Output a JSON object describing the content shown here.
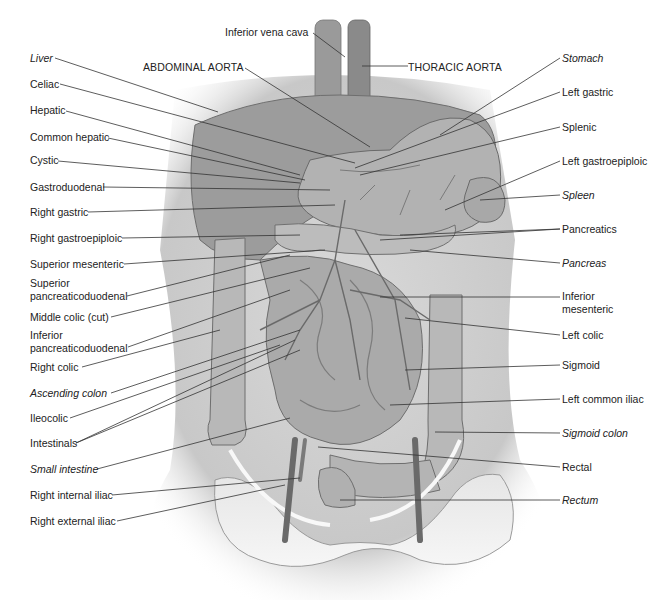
{
  "diagram": {
    "type": "anatomical-illustration",
    "top_labels": {
      "inferior_vena_cava": "Inferior vena cava",
      "abdominal_aorta": "ABDOMINAL AORTA",
      "thoracic_aorta": "THORACIC AORTA"
    },
    "left_labels": [
      {
        "text": "Liver",
        "italic": true
      },
      {
        "text": "Celiac",
        "italic": false
      },
      {
        "text": "Hepatic",
        "italic": false
      },
      {
        "text": "Common hepatic",
        "italic": false
      },
      {
        "text": "Cystic",
        "italic": false
      },
      {
        "text": "Gastroduodenal",
        "italic": false
      },
      {
        "text": "Right gastric",
        "italic": false
      },
      {
        "text": "Right gastroepiploic",
        "italic": false
      },
      {
        "text": "Superior mesenteric",
        "italic": false
      },
      {
        "text": "Superior",
        "text2": "pancreaticoduodenal",
        "italic": false
      },
      {
        "text": "Middle colic (cut)",
        "italic": false
      },
      {
        "text": "Inferior",
        "text2": "pancreaticoduodenal",
        "italic": false
      },
      {
        "text": "Right colic",
        "italic": false
      },
      {
        "text": "Ascending colon",
        "italic": true
      },
      {
        "text": "Ileocolic",
        "italic": false
      },
      {
        "text": "Intestinals",
        "italic": false
      },
      {
        "text": "Small intestine",
        "italic": true
      },
      {
        "text": "Right internal iliac",
        "italic": false
      },
      {
        "text": "Right external iliac",
        "italic": false
      }
    ],
    "right_labels": [
      {
        "text": "Stomach",
        "italic": true
      },
      {
        "text": "Left gastric",
        "italic": false
      },
      {
        "text": "Splenic",
        "italic": false
      },
      {
        "text": "Left gastroepiploic",
        "italic": false
      },
      {
        "text": "Spleen",
        "italic": true
      },
      {
        "text": "Pancreatics",
        "italic": false
      },
      {
        "text": "Pancreas",
        "italic": true
      },
      {
        "text": "Inferior",
        "text2": "mesenteric",
        "italic": false
      },
      {
        "text": "Left colic",
        "italic": false
      },
      {
        "text": "Sigmoid",
        "italic": false
      },
      {
        "text": "Left common iliac",
        "italic": false
      },
      {
        "text": "Sigmoid colon",
        "italic": true
      },
      {
        "text": "Rectal",
        "italic": false
      },
      {
        "text": "Rectum",
        "italic": true
      }
    ]
  }
}
